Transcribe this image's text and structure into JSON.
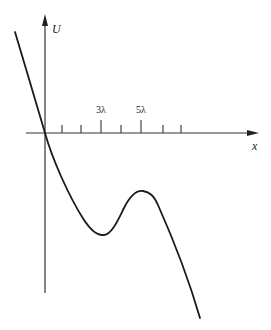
{
  "figure": {
    "type": "potential-energy-curve",
    "axes": {
      "y_label": "U",
      "x_label": "x"
    },
    "tick_labels": [
      {
        "text": "3λ",
        "x": 101
      },
      {
        "text": "5λ",
        "x": 141
      }
    ],
    "tick_positions_x": [
      62,
      81,
      101,
      121,
      141,
      163,
      181
    ],
    "major_ticks_x": [
      101,
      141
    ],
    "curve": {
      "description": "Steeply decreasing through origin, local minimum near 3λ, local maximum near 5λ, then decreasing",
      "local_minimum_near": "3λ",
      "local_maximum_near": "5λ"
    },
    "colors": {
      "stroke": "#1a1a1a",
      "axis": "#333333",
      "background": "#ffffff"
    }
  }
}
